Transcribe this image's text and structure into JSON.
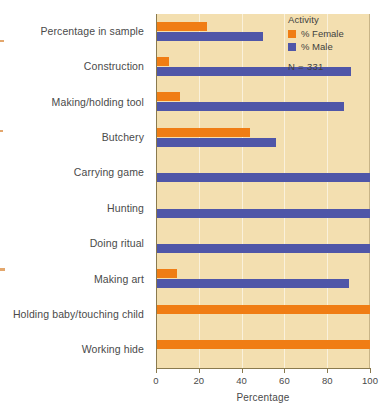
{
  "chart_data": {
    "type": "bar",
    "orientation": "horizontal",
    "title": "",
    "xlabel": "Percentage",
    "ylabel": "",
    "xlim": [
      0,
      100
    ],
    "xticks": [
      0,
      20,
      40,
      60,
      80,
      100
    ],
    "grid": true,
    "legend_position": "top-right",
    "categories": [
      "Percentage in sample",
      "Construction",
      "Making/holding tool",
      "Butchery",
      "Carrying game",
      "Hunting",
      "Doing ritual",
      "Making art",
      "Holding baby/touching child",
      "Working hide"
    ],
    "series": [
      {
        "name": "% Female",
        "color": "#f07d14",
        "values": [
          24,
          6,
          11,
          44,
          0,
          0,
          0,
          10,
          100,
          100
        ]
      },
      {
        "name": "% Male",
        "color": "#4f56a8",
        "values": [
          50,
          91,
          88,
          56,
          100,
          100,
          100,
          90,
          0,
          0
        ]
      }
    ],
    "annotations": [
      "N = 331"
    ]
  },
  "legend": {
    "title": "Activity",
    "entries": [
      {
        "label": "% Female",
        "color": "#f07d14"
      },
      {
        "label": "% Male",
        "color": "#4f56a8"
      }
    ],
    "note": "N = 331"
  },
  "axes": {
    "x_title": "Percentage",
    "x_ticks": [
      "0",
      "20",
      "40",
      "60",
      "80",
      "100"
    ]
  },
  "colors": {
    "plot_background": "#f3dfb0",
    "page_background": "#ffffff",
    "female": "#f07d14",
    "male": "#4f56a8",
    "axis": "#8a7a4e"
  }
}
